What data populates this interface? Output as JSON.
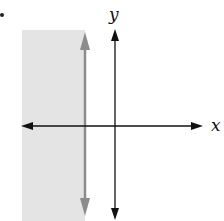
{
  "figure": {
    "type": "inequality-graph",
    "bullet": "•",
    "axes": {
      "x_label": "x",
      "y_label": "y"
    },
    "boundary": {
      "orientation": "vertical",
      "style": "solid",
      "position": "left of y-axis",
      "color": "#8c8c8c"
    },
    "shading": {
      "side": "left",
      "color": "#e4e4e4"
    },
    "colors": {
      "axes": "#111111",
      "boundary": "#8c8c8c",
      "shade": "#e4e4e4"
    }
  }
}
